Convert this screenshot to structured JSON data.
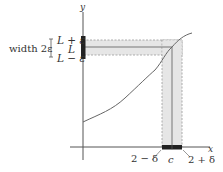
{
  "diagram": {
    "axes": {
      "x_label": "x",
      "y_label": "y"
    },
    "y_labels": {
      "upper": "L + ε",
      "center": "L",
      "lower": "L − ε",
      "width_label": "width 2ε"
    },
    "x_labels": {
      "left": "2 − δ",
      "center": "c",
      "right": "2 + δ"
    },
    "colors": {
      "band_fill": "#e6e6e6",
      "band_border": "#999999",
      "axis": "#555555",
      "curve": "#666666",
      "interval_marker": "#222222"
    }
  }
}
